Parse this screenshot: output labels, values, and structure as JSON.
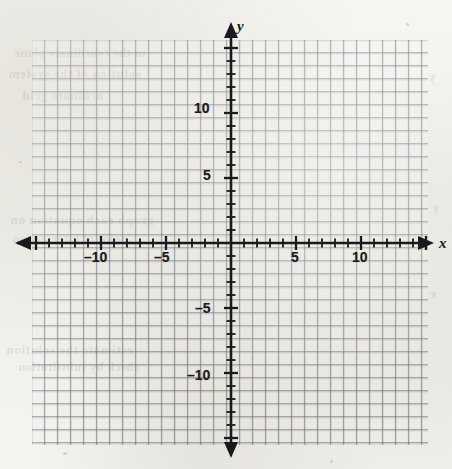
{
  "figure": {
    "kind": "cartesian-coordinate-grid",
    "title": "",
    "background_color": "#f2f1ee",
    "grid_color": "#6c7078",
    "axis_color": "#1a1a1c"
  },
  "axis_labels": {
    "x": "x",
    "y": "y"
  },
  "ghost_text": [
    {
      "text": "in the coordinate plane",
      "x": 14,
      "y": 46,
      "size": 12
    },
    {
      "text": "solution of the system",
      "x": 8,
      "y": 66,
      "size": 13
    },
    {
      "text": "ordinate grid",
      "x": 22,
      "y": 88,
      "size": 13
    },
    {
      "text": "graph each equation on",
      "x": 10,
      "y": 212,
      "size": 13
    },
    {
      "text": "point of intersection",
      "x": 12,
      "y": 232,
      "size": 12
    },
    {
      "text": "estimate the solution",
      "x": 6,
      "y": 342,
      "size": 13
    },
    {
      "text": "check by substitution",
      "x": 18,
      "y": 360,
      "size": 12
    },
    {
      "text": "y",
      "x": 428,
      "y": 70,
      "size": 14
    },
    {
      "text": "y",
      "x": 432,
      "y": 200,
      "size": 13
    },
    {
      "text": "x",
      "x": 430,
      "y": 286,
      "size": 13
    }
  ],
  "chart_data": {
    "type": "scatter",
    "title": "",
    "xlabel": "x",
    "ylabel": "y",
    "grid": true,
    "grid_step": 1,
    "legend": "none",
    "series": [],
    "x": [],
    "y": [],
    "xlim": [
      -15.3,
      15.2
    ],
    "ylim": [
      -15.6,
      15.7
    ],
    "x_ticks_major": [
      -10,
      -5,
      5,
      10
    ],
    "y_ticks_major": [
      -10,
      -5,
      5,
      10
    ],
    "x_tick_labels": [
      "–10",
      "–5",
      "5",
      "10"
    ],
    "y_tick_labels": [
      "–10",
      "–5",
      "5",
      "10"
    ],
    "tick_interval_minor": 1,
    "origin_label": ""
  },
  "geometry": {
    "plate_left": 32,
    "plate_top": 40,
    "plate_width": 396,
    "plate_height": 405,
    "cell_px": 13,
    "origin_x": 199,
    "origin_y": 203
  },
  "tick_labels": {
    "x_neg_10": "–10",
    "x_neg_5": "–5",
    "x_pos_5": "5",
    "x_pos_10": "10",
    "y_neg_10": "–10",
    "y_neg_5": "–5",
    "y_pos_5": "5",
    "y_pos_10": "10"
  }
}
